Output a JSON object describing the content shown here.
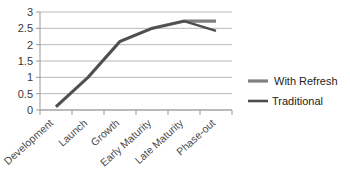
{
  "chart_data": {
    "type": "line",
    "title": "",
    "xlabel": "",
    "ylabel": "",
    "categories": [
      "Development",
      "Launch",
      "Growth",
      "Early Maturity",
      "Late Maturity",
      "Phase-out"
    ],
    "ylim": [
      0,
      3
    ],
    "ytick_labels": [
      "0",
      "0.5",
      "1",
      "1.5",
      "2",
      "2.5",
      "3"
    ],
    "ytick_values": [
      0,
      0.5,
      1,
      1.5,
      2,
      2.5,
      3
    ],
    "grid": true,
    "legend_position": "right",
    "series": [
      {
        "name": "With Refresh",
        "color": "#808080",
        "values": [
          0.1,
          1.0,
          2.1,
          2.5,
          2.72,
          2.72
        ]
      },
      {
        "name": "Traditional",
        "color": "#4d4d4d",
        "values": [
          0.1,
          1.0,
          2.1,
          2.5,
          2.72,
          2.42
        ]
      }
    ]
  },
  "legend": {
    "items": [
      {
        "label": "With Refresh",
        "color": "#808080"
      },
      {
        "label": "Traditional",
        "color": "#4d4d4d"
      }
    ]
  },
  "axis": {
    "y_labels": [
      "3",
      "2.5",
      "2",
      "1.5",
      "1",
      "0.5",
      "0"
    ],
    "x_labels": [
      "Development",
      "Launch",
      "Growth",
      "Early Maturity",
      "Late Maturity",
      "Phase-out"
    ]
  },
  "colors": {
    "with_refresh": "#808080",
    "traditional": "#4d4d4d",
    "gridline": "#b0b0b0",
    "axis": "#9a9a9a",
    "background": "#ffffff"
  }
}
